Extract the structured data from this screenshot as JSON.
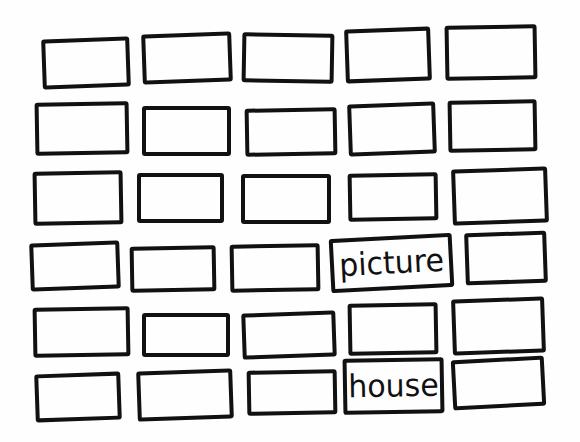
{
  "diagram": {
    "type": "hand-drawn grid of rectangles",
    "rows": 6,
    "columns": 5,
    "stroke_color": "#111111",
    "background_color": "#fefefe",
    "labels": [
      "picture",
      "house"
    ],
    "boxes": [
      {
        "row": 1,
        "col": 1,
        "x": 42,
        "y": 38,
        "w": 88,
        "h": 50,
        "rot": -2,
        "label": ""
      },
      {
        "row": 1,
        "col": 2,
        "x": 142,
        "y": 33,
        "w": 90,
        "h": 50,
        "rot": -2,
        "label": ""
      },
      {
        "row": 1,
        "col": 3,
        "x": 242,
        "y": 33,
        "w": 92,
        "h": 50,
        "rot": 1,
        "label": ""
      },
      {
        "row": 1,
        "col": 4,
        "x": 345,
        "y": 28,
        "w": 86,
        "h": 54,
        "rot": -2,
        "label": ""
      },
      {
        "row": 1,
        "col": 5,
        "x": 445,
        "y": 25,
        "w": 92,
        "h": 55,
        "rot": -1,
        "label": ""
      },
      {
        "row": 2,
        "col": 1,
        "x": 35,
        "y": 102,
        "w": 94,
        "h": 53,
        "rot": -1,
        "label": ""
      },
      {
        "row": 2,
        "col": 2,
        "x": 142,
        "y": 106,
        "w": 89,
        "h": 50,
        "rot": 0,
        "label": ""
      },
      {
        "row": 2,
        "col": 3,
        "x": 245,
        "y": 108,
        "w": 92,
        "h": 48,
        "rot": -1,
        "label": ""
      },
      {
        "row": 2,
        "col": 4,
        "x": 348,
        "y": 103,
        "w": 88,
        "h": 52,
        "rot": -2,
        "label": ""
      },
      {
        "row": 2,
        "col": 5,
        "x": 448,
        "y": 100,
        "w": 89,
        "h": 52,
        "rot": -1,
        "label": ""
      },
      {
        "row": 3,
        "col": 1,
        "x": 33,
        "y": 171,
        "w": 90,
        "h": 54,
        "rot": -1,
        "label": ""
      },
      {
        "row": 3,
        "col": 2,
        "x": 137,
        "y": 173,
        "w": 87,
        "h": 50,
        "rot": 0,
        "label": ""
      },
      {
        "row": 3,
        "col": 3,
        "x": 241,
        "y": 174,
        "w": 90,
        "h": 50,
        "rot": 0,
        "label": ""
      },
      {
        "row": 3,
        "col": 4,
        "x": 348,
        "y": 173,
        "w": 90,
        "h": 48,
        "rot": -1,
        "label": ""
      },
      {
        "row": 3,
        "col": 5,
        "x": 452,
        "y": 168,
        "w": 96,
        "h": 56,
        "rot": -2,
        "label": ""
      },
      {
        "row": 4,
        "col": 1,
        "x": 30,
        "y": 242,
        "w": 90,
        "h": 48,
        "rot": -2,
        "label": ""
      },
      {
        "row": 4,
        "col": 2,
        "x": 130,
        "y": 246,
        "w": 86,
        "h": 46,
        "rot": -1,
        "label": ""
      },
      {
        "row": 4,
        "col": 3,
        "x": 230,
        "y": 244,
        "w": 90,
        "h": 48,
        "rot": -1,
        "label": ""
      },
      {
        "row": 4,
        "col": 4,
        "x": 330,
        "y": 236,
        "w": 123,
        "h": 54,
        "rot": -3,
        "label": "picture"
      },
      {
        "row": 4,
        "col": 5,
        "x": 465,
        "y": 232,
        "w": 82,
        "h": 52,
        "rot": -2,
        "label": ""
      },
      {
        "row": 5,
        "col": 1,
        "x": 33,
        "y": 307,
        "w": 97,
        "h": 50,
        "rot": -1,
        "label": ""
      },
      {
        "row": 5,
        "col": 2,
        "x": 142,
        "y": 313,
        "w": 88,
        "h": 44,
        "rot": 0,
        "label": ""
      },
      {
        "row": 5,
        "col": 3,
        "x": 242,
        "y": 312,
        "w": 94,
        "h": 46,
        "rot": -2,
        "label": ""
      },
      {
        "row": 5,
        "col": 4,
        "x": 348,
        "y": 303,
        "w": 90,
        "h": 52,
        "rot": -1,
        "label": ""
      },
      {
        "row": 5,
        "col": 5,
        "x": 452,
        "y": 298,
        "w": 93,
        "h": 56,
        "rot": -2,
        "label": ""
      },
      {
        "row": 6,
        "col": 1,
        "x": 35,
        "y": 373,
        "w": 86,
        "h": 48,
        "rot": -2,
        "label": ""
      },
      {
        "row": 6,
        "col": 2,
        "x": 137,
        "y": 370,
        "w": 96,
        "h": 50,
        "rot": -2,
        "label": ""
      },
      {
        "row": 6,
        "col": 3,
        "x": 247,
        "y": 370,
        "w": 90,
        "h": 45,
        "rot": -1,
        "label": ""
      },
      {
        "row": 6,
        "col": 4,
        "x": 343,
        "y": 358,
        "w": 101,
        "h": 56,
        "rot": -1,
        "label": "house"
      },
      {
        "row": 6,
        "col": 5,
        "x": 452,
        "y": 358,
        "w": 93,
        "h": 50,
        "rot": -3,
        "label": ""
      }
    ]
  }
}
